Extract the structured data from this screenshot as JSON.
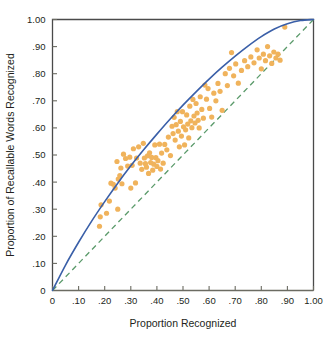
{
  "chart_data": {
    "type": "scatter",
    "title": "",
    "xlabel": "Proportion Recognized",
    "ylabel": "Proportion of Recallable Words Recognized",
    "xlim": [
      0,
      1.0
    ],
    "ylim": [
      0,
      1.0
    ],
    "grid": false,
    "legend": "none",
    "xticks": [
      0,
      0.1,
      0.2,
      0.3,
      0.4,
      0.5,
      0.6,
      0.7,
      0.8,
      0.9,
      1.0
    ],
    "yticks": [
      0,
      0.1,
      0.2,
      0.3,
      0.4,
      0.5,
      0.6,
      0.7,
      0.8,
      0.9,
      1.0
    ],
    "xticklabels": [
      "0",
      ".10",
      ".20",
      ".30",
      ".40",
      ".50",
      ".60",
      ".70",
      ".80",
      ".90",
      "1.00"
    ],
    "yticklabels": [
      "0",
      ".10",
      ".20",
      ".30",
      ".40",
      ".50",
      ".60",
      ".70",
      ".80",
      ".90",
      "1.00"
    ],
    "point_color": "#f0b35c",
    "point_radius": 2.6,
    "series": [
      {
        "name": "observations",
        "type": "scatter",
        "points": [
          [
            0.18,
            0.237
          ],
          [
            0.183,
            0.272
          ],
          [
            0.186,
            0.316
          ],
          [
            0.207,
            0.285
          ],
          [
            0.218,
            0.33
          ],
          [
            0.224,
            0.396
          ],
          [
            0.233,
            0.392
          ],
          [
            0.24,
            0.378
          ],
          [
            0.247,
            0.476
          ],
          [
            0.25,
            0.3
          ],
          [
            0.252,
            0.411
          ],
          [
            0.258,
            0.424
          ],
          [
            0.262,
            0.452
          ],
          [
            0.266,
            0.394
          ],
          [
            0.272,
            0.503
          ],
          [
            0.28,
            0.487
          ],
          [
            0.288,
            0.459
          ],
          [
            0.296,
            0.492
          ],
          [
            0.3,
            0.378
          ],
          [
            0.305,
            0.462
          ],
          [
            0.31,
            0.523
          ],
          [
            0.318,
            0.397
          ],
          [
            0.322,
            0.489
          ],
          [
            0.33,
            0.53
          ],
          [
            0.336,
            0.47
          ],
          [
            0.342,
            0.447
          ],
          [
            0.348,
            0.543
          ],
          [
            0.352,
            0.489
          ],
          [
            0.356,
            0.468
          ],
          [
            0.36,
            0.455
          ],
          [
            0.364,
            0.497
          ],
          [
            0.368,
            0.432
          ],
          [
            0.372,
            0.508
          ],
          [
            0.376,
            0.472
          ],
          [
            0.38,
            0.491
          ],
          [
            0.384,
            0.444
          ],
          [
            0.388,
            0.466
          ],
          [
            0.392,
            0.537
          ],
          [
            0.396,
            0.49
          ],
          [
            0.4,
            0.458
          ],
          [
            0.404,
            0.479
          ],
          [
            0.41,
            0.54
          ],
          [
            0.414,
            0.448
          ],
          [
            0.418,
            0.507
          ],
          [
            0.424,
            0.47
          ],
          [
            0.43,
            0.539
          ],
          [
            0.438,
            0.519
          ],
          [
            0.444,
            0.566
          ],
          [
            0.452,
            0.498
          ],
          [
            0.458,
            0.606
          ],
          [
            0.462,
            0.579
          ],
          [
            0.466,
            0.639
          ],
          [
            0.47,
            0.555
          ],
          [
            0.474,
            0.612
          ],
          [
            0.478,
            0.66
          ],
          [
            0.482,
            0.588
          ],
          [
            0.486,
            0.53
          ],
          [
            0.49,
            0.624
          ],
          [
            0.494,
            0.57
          ],
          [
            0.498,
            0.66
          ],
          [
            0.502,
            0.604
          ],
          [
            0.506,
            0.537
          ],
          [
            0.51,
            0.593
          ],
          [
            0.514,
            0.648
          ],
          [
            0.518,
            0.614
          ],
          [
            0.522,
            0.563
          ],
          [
            0.526,
            0.68
          ],
          [
            0.53,
            0.626
          ],
          [
            0.534,
            0.601
          ],
          [
            0.538,
            0.705
          ],
          [
            0.542,
            0.644
          ],
          [
            0.546,
            0.618
          ],
          [
            0.55,
            0.69
          ],
          [
            0.554,
            0.655
          ],
          [
            0.558,
            0.628
          ],
          [
            0.562,
            0.6
          ],
          [
            0.566,
            0.715
          ],
          [
            0.572,
            0.668
          ],
          [
            0.578,
            0.636
          ],
          [
            0.584,
            0.758
          ],
          [
            0.59,
            0.706
          ],
          [
            0.596,
            0.745
          ],
          [
            0.602,
            0.672
          ],
          [
            0.61,
            0.64
          ],
          [
            0.618,
            0.728
          ],
          [
            0.626,
            0.7
          ],
          [
            0.634,
            0.764
          ],
          [
            0.642,
            0.735
          ],
          [
            0.65,
            0.665
          ],
          [
            0.662,
            0.8
          ],
          [
            0.67,
            0.756
          ],
          [
            0.678,
            0.82
          ],
          [
            0.686,
            0.878
          ],
          [
            0.694,
            0.792
          ],
          [
            0.702,
            0.836
          ],
          [
            0.712,
            0.765
          ],
          [
            0.724,
            0.812
          ],
          [
            0.736,
            0.848
          ],
          [
            0.748,
            0.826
          ],
          [
            0.76,
            0.862
          ],
          [
            0.772,
            0.84
          ],
          [
            0.784,
            0.888
          ],
          [
            0.792,
            0.858
          ],
          [
            0.8,
            0.818
          ],
          [
            0.808,
            0.872
          ],
          [
            0.816,
            0.848
          ],
          [
            0.824,
            0.9
          ],
          [
            0.832,
            0.866
          ],
          [
            0.84,
            0.838
          ],
          [
            0.848,
            0.88
          ],
          [
            0.856,
            0.858
          ],
          [
            0.864,
            0.872
          ],
          [
            0.872,
            0.85
          ],
          [
            0.89,
            0.972
          ]
        ]
      },
      {
        "name": "fitted-curve",
        "type": "line",
        "style": "solid",
        "color": "#3a5fa8",
        "width": 1.6,
        "points": [
          [
            0.0,
            0.0
          ],
          [
            0.05,
            0.094
          ],
          [
            0.1,
            0.178
          ],
          [
            0.15,
            0.256
          ],
          [
            0.2,
            0.328
          ],
          [
            0.25,
            0.396
          ],
          [
            0.3,
            0.46
          ],
          [
            0.35,
            0.52
          ],
          [
            0.4,
            0.577
          ],
          [
            0.45,
            0.632
          ],
          [
            0.5,
            0.684
          ],
          [
            0.55,
            0.733
          ],
          [
            0.6,
            0.78
          ],
          [
            0.65,
            0.824
          ],
          [
            0.7,
            0.865
          ],
          [
            0.75,
            0.903
          ],
          [
            0.8,
            0.937
          ],
          [
            0.85,
            0.965
          ],
          [
            0.9,
            0.984
          ],
          [
            0.95,
            0.996
          ],
          [
            1.0,
            1.0
          ]
        ]
      },
      {
        "name": "identity-line",
        "type": "line",
        "style": "dashed",
        "color": "#5a9a6a",
        "width": 1.3,
        "points": [
          [
            0.0,
            0.0
          ],
          [
            1.0,
            1.0
          ]
        ]
      }
    ]
  },
  "axes": {
    "x_title": "Proportion Recognized",
    "y_title": "Proportion of Recallable Words Recognized"
  }
}
